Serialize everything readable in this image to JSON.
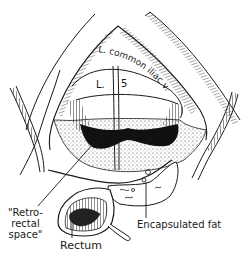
{
  "figure": {
    "type": "anatomical-illustration",
    "style": "black-and-white line drawing",
    "colors": {
      "ink": "#1a1a1a",
      "background": "#ffffff",
      "cavity": "#111111"
    },
    "labels": {
      "vessel": "L. common iliac v.",
      "vertebra_left": "L.",
      "vertebra_right": "5",
      "retrorectal_line1": "\"Retro-",
      "retrorectal_line2": "rectal",
      "retrorectal_line3": "space\"",
      "rectum": "Rectum",
      "encapsulated_fat": "Encapsulated fat"
    }
  }
}
